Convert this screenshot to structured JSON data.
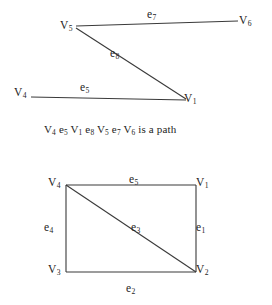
{
  "document": {
    "type": "graph-theory-figure",
    "ink_color": "#3a3a3a",
    "text_color": "#242424"
  },
  "top_graph": {
    "name": "path-graph",
    "vertices": [
      {
        "id": "V5",
        "base": "V",
        "sub": "5",
        "x": 60,
        "y": 20
      },
      {
        "id": "V6",
        "base": "V",
        "sub": "6",
        "x": 239,
        "y": 15
      },
      {
        "id": "V4",
        "base": "V",
        "sub": "4",
        "x": 14,
        "y": 87
      },
      {
        "id": "V1",
        "base": "V",
        "sub": "1",
        "x": 184,
        "y": 93
      }
    ],
    "edges": [
      {
        "id": "e7",
        "base": "e",
        "sub": "7",
        "from": "V5",
        "to": "V6",
        "x": 147,
        "y": 9
      },
      {
        "id": "e8",
        "base": "e",
        "sub": "8",
        "from": "V5",
        "to": "V1",
        "x": 110,
        "y": 48
      },
      {
        "id": "e5",
        "base": "e",
        "sub": "5",
        "from": "V4",
        "to": "V1",
        "x": 80,
        "y": 82
      }
    ]
  },
  "caption": {
    "name": "path-caption",
    "tokens": [
      {
        "base": "V",
        "sub": "4"
      },
      {
        "base": "e",
        "sub": "5"
      },
      {
        "base": "V",
        "sub": "1"
      },
      {
        "base": "e",
        "sub": "8"
      },
      {
        "base": "V",
        "sub": "5"
      },
      {
        "base": "e",
        "sub": "7"
      },
      {
        "base": "V",
        "sub": "6"
      }
    ],
    "trailing_text": "is a path",
    "full_text": "V4 e5 V1 e8 V5 e7 V6 is a path",
    "x": 44,
    "y": 123
  },
  "bottom_graph": {
    "name": "cycle-graph-with-diagonal",
    "vertices": [
      {
        "id": "V4",
        "base": "V",
        "sub": "4",
        "x": 48,
        "y": 177
      },
      {
        "id": "V1",
        "base": "V",
        "sub": "1",
        "x": 196,
        "y": 177
      },
      {
        "id": "V3",
        "base": "V",
        "sub": "3",
        "x": 48,
        "y": 264
      },
      {
        "id": "V2",
        "base": "V",
        "sub": "2",
        "x": 196,
        "y": 264
      }
    ],
    "edges": [
      {
        "id": "e5",
        "base": "e",
        "sub": "5",
        "from": "V4",
        "to": "V1",
        "x": 129,
        "y": 174
      },
      {
        "id": "e1",
        "base": "e",
        "sub": "1",
        "from": "V1",
        "to": "V2",
        "x": 196,
        "y": 222
      },
      {
        "id": "e2",
        "base": "e",
        "sub": "2",
        "from": "V3",
        "to": "V2",
        "x": 126,
        "y": 283
      },
      {
        "id": "e4",
        "base": "e",
        "sub": "4",
        "from": "V4",
        "to": "V3",
        "x": 44,
        "y": 222
      },
      {
        "id": "e3",
        "base": "e",
        "sub": "3",
        "from": "V4",
        "to": "V2",
        "x": 131,
        "y": 222
      }
    ]
  }
}
